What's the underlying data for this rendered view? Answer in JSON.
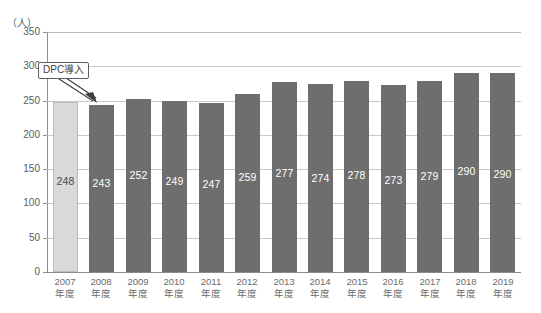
{
  "header": {
    "clipped_strip_text": "",
    "y_unit_label": "（人）"
  },
  "annotation": {
    "label": "DPC導入",
    "points_to_category": "2008年度"
  },
  "axis": {
    "y_ticks": [
      "0",
      "50",
      "100",
      "150",
      "200",
      "250",
      "300",
      "350"
    ],
    "x_suffix": "年度"
  },
  "chart_data": {
    "type": "bar",
    "title": "",
    "subtitle": "",
    "xlabel": "",
    "ylabel": "（人）",
    "ylim": [
      0,
      350
    ],
    "ytick_step": 50,
    "grid": true,
    "legend": "none",
    "categories": [
      "2007年度",
      "2008年度",
      "2009年度",
      "2010年度",
      "2011年度",
      "2012年度",
      "2013年度",
      "2014年度",
      "2015年度",
      "2016年度",
      "2017年度",
      "2018年度",
      "2019年度"
    ],
    "category_years": [
      "2007",
      "2008",
      "2009",
      "2010",
      "2011",
      "2012",
      "2013",
      "2014",
      "2015",
      "2016",
      "2017",
      "2018",
      "2019"
    ],
    "values": [
      248,
      243,
      252,
      249,
      247,
      259,
      277,
      274,
      278,
      273,
      279,
      290,
      290
    ],
    "bar_colors": [
      "#d9d9d9",
      "#6e6e6e",
      "#6e6e6e",
      "#6e6e6e",
      "#6e6e6e",
      "#6e6e6e",
      "#6e6e6e",
      "#6e6e6e",
      "#6e6e6e",
      "#6e6e6e",
      "#6e6e6e",
      "#6e6e6e",
      "#6e6e6e"
    ],
    "highlight_index": 0,
    "annotations": [
      {
        "text": "DPC導入",
        "target_category": "2008年度"
      }
    ]
  },
  "colors": {
    "bar_dark": "#6e6e6e",
    "bar_light": "#d9d9d9",
    "grid": "#c9c9c9",
    "axis": "#8c8c8c",
    "label_text": "#6b6b6b",
    "value_text_on_dark": "#ffffff",
    "value_text_on_light": "#4a4a4a"
  }
}
